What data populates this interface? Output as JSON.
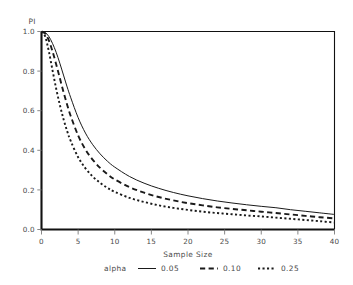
{
  "chart_data": {
    "type": "line",
    "title": "",
    "ylabel": "PI",
    "xlabel": "Sample Size",
    "xlim": [
      0,
      40
    ],
    "ylim": [
      0.0,
      1.0
    ],
    "xticks": [
      0,
      5,
      10,
      15,
      20,
      25,
      30,
      35,
      40
    ],
    "xtick_labels": [
      "0",
      "5",
      "10",
      "15",
      "20",
      "25",
      "30",
      "35",
      "40"
    ],
    "yticks": [
      0.0,
      0.2,
      0.4,
      0.6,
      0.8,
      1.0
    ],
    "ytick_labels": [
      "0.0",
      "0.2",
      "0.4",
      "0.6",
      "0.8",
      "1.0"
    ],
    "grid": false,
    "legend_position": "bottom",
    "legend_title": "alpha",
    "x": [
      0,
      0.5,
      1,
      1.5,
      2,
      2.5,
      3,
      3.5,
      4,
      5,
      6,
      7,
      8,
      9,
      10,
      12,
      14,
      16,
      18,
      20,
      22,
      24,
      26,
      28,
      30,
      32,
      34,
      36,
      38,
      40
    ],
    "series": [
      {
        "name": "0.05",
        "label": "0.05",
        "linestyle": "solid",
        "color": "#1a1a1a",
        "values": [
          1.0,
          0.995,
          0.975,
          0.94,
          0.895,
          0.84,
          0.78,
          0.72,
          0.665,
          0.565,
          0.487,
          0.428,
          0.382,
          0.345,
          0.315,
          0.268,
          0.234,
          0.208,
          0.187,
          0.17,
          0.156,
          0.144,
          0.134,
          0.125,
          0.117,
          0.11,
          0.1,
          0.092,
          0.084,
          0.076
        ]
      },
      {
        "name": "0.10",
        "label": "0.10",
        "linestyle": "dashed",
        "color": "#1a1a1a",
        "values": [
          1.0,
          0.99,
          0.955,
          0.9,
          0.835,
          0.765,
          0.695,
          0.63,
          0.572,
          0.475,
          0.404,
          0.352,
          0.311,
          0.279,
          0.253,
          0.214,
          0.186,
          0.164,
          0.147,
          0.133,
          0.122,
          0.112,
          0.104,
          0.097,
          0.09,
          0.083,
          0.076,
          0.069,
          0.062,
          0.056
        ]
      },
      {
        "name": "0.25",
        "label": "0.25",
        "linestyle": "dotted",
        "color": "#1a1a1a",
        "values": [
          1.0,
          0.975,
          0.9,
          0.805,
          0.712,
          0.63,
          0.558,
          0.497,
          0.446,
          0.365,
          0.309,
          0.267,
          0.236,
          0.21,
          0.19,
          0.16,
          0.139,
          0.122,
          0.109,
          0.099,
          0.09,
          0.083,
          0.077,
          0.071,
          0.066,
          0.06,
          0.054,
          0.048,
          0.042,
          0.035
        ]
      }
    ]
  },
  "legend": {
    "title": "alpha",
    "entries": [
      {
        "label": "0.05",
        "style": "solid"
      },
      {
        "label": "0.10",
        "style": "dashed"
      },
      {
        "label": "0.25",
        "style": "dotted"
      }
    ]
  },
  "axes": {
    "y_axis_label": "PI",
    "x_axis_label": "Sample Size"
  }
}
